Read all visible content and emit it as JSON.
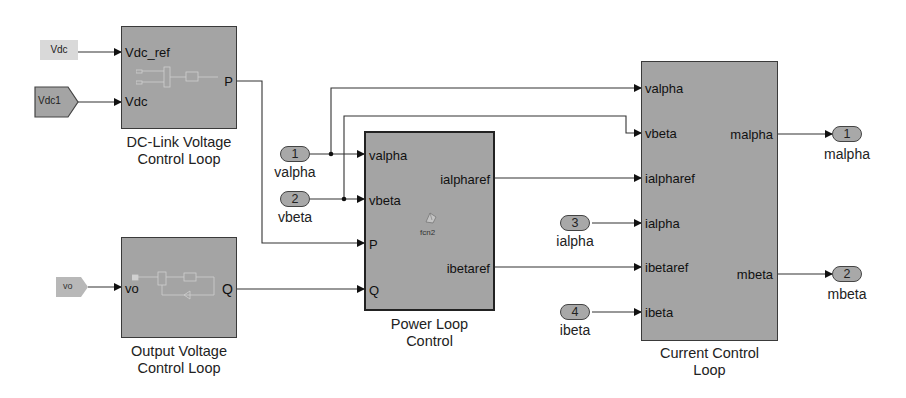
{
  "diagram": {
    "sources": {
      "vdc_constant": {
        "label": "Vdc"
      },
      "vdc1_from": {
        "label": "Vdc1"
      },
      "vo_from": {
        "label": "vo"
      }
    },
    "subsystems": {
      "dc_link": {
        "name_line1": "DC-Link Voltage",
        "name_line2": "Control Loop",
        "inputs": [
          "Vdc_ref",
          "Vdc"
        ],
        "outputs": [
          "P"
        ]
      },
      "output_voltage": {
        "name_line1": "Output Voltage",
        "name_line2": "Control Loop",
        "inputs": [
          "vo"
        ],
        "outputs": [
          "Q"
        ]
      },
      "power_loop": {
        "name_line1": "Power Loop",
        "name_line2": "Control",
        "inputs": [
          "valpha",
          "vbeta",
          "P",
          "Q"
        ],
        "outputs": [
          "ialpharef",
          "ibetaref"
        ],
        "function_name": "fcn2"
      },
      "current_control": {
        "name_line1": "Current Control",
        "name_line2": "Loop",
        "inputs": [
          "valpha",
          "vbeta",
          "ialpharef",
          "ialpha",
          "ibetaref",
          "ibeta"
        ],
        "outputs": [
          "malpha",
          "mbeta"
        ]
      }
    },
    "inports": [
      {
        "number": "1",
        "name": "valpha"
      },
      {
        "number": "2",
        "name": "vbeta"
      },
      {
        "number": "3",
        "name": "ialpha"
      },
      {
        "number": "4",
        "name": "ibeta"
      }
    ],
    "outports": [
      {
        "number": "1",
        "name": "malpha"
      },
      {
        "number": "2",
        "name": "mbeta"
      }
    ],
    "colors": {
      "block_fill": "#a4a4a4",
      "constant_fill": "#d9d9d9",
      "wire": "#333333",
      "background": "#ffffff"
    }
  }
}
